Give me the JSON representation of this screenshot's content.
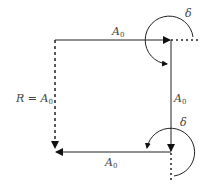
{
  "diagram": {
    "labels": {
      "top": {
        "main": "A",
        "sub": "0"
      },
      "right": {
        "main": "A",
        "sub": "0"
      },
      "bottom": {
        "main": "A",
        "sub": "0"
      },
      "resultant": {
        "prefix": "R = ",
        "main": "A",
        "sub": "0"
      },
      "delta_top": "δ",
      "delta_bottom": "δ"
    },
    "colors": {
      "line": "#222222",
      "text": "#444444"
    }
  }
}
